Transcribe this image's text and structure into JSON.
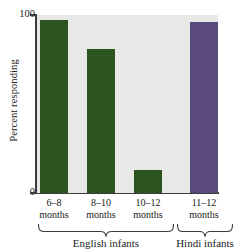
{
  "chart_data": {
    "type": "bar",
    "title": "",
    "xlabel": "",
    "ylabel": "Percent responding",
    "ylim": [
      0,
      100
    ],
    "yticks": [
      "0",
      "100"
    ],
    "grid": false,
    "legend": "none",
    "categories": [
      "6–8\nmonths",
      "8–10\nmonths",
      "10–12\nmonths",
      "11–12\nmonths"
    ],
    "values": [
      97,
      81,
      13,
      96
    ],
    "series": [
      {
        "name": "Percent responding",
        "values": [
          97,
          81,
          13,
          96
        ]
      }
    ],
    "bars": [
      {
        "label_line1": "6–8",
        "label_line2": "months",
        "value": 97,
        "color": "#2b5420",
        "group": "English infants"
      },
      {
        "label_line1": "8–10",
        "label_line2": "months",
        "value": 81,
        "color": "#2b5420",
        "group": "English infants"
      },
      {
        "label_line1": "10–12",
        "label_line2": "months",
        "value": 13,
        "color": "#2b5420",
        "group": "English infants"
      },
      {
        "label_line1": "11–12",
        "label_line2": "months",
        "value": 96,
        "color": "#5a4a7d",
        "group": "Hindi infants"
      }
    ],
    "groups": [
      {
        "label": "English infants",
        "bars": [
          0,
          1,
          2
        ]
      },
      {
        "label": "Hindi infants",
        "bars": [
          3
        ]
      }
    ],
    "colors": {
      "english_bar": "#2b5420",
      "hindi_bar": "#5a4a7d",
      "plot_background": "#e8e8e6",
      "axis": "#3b3b3b",
      "text": "#1a1a1a",
      "page_background": "#ffffff"
    }
  },
  "axis": {
    "y_title": "Percent responding",
    "y_top_tick": "100",
    "y_bottom_tick": "0"
  },
  "groups": {
    "english": "English infants",
    "hindi": "Hindi infants"
  }
}
